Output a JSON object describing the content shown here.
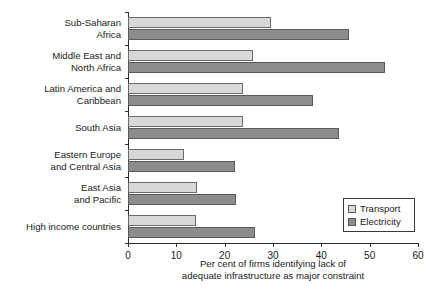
{
  "chart_data": {
    "type": "bar",
    "orientation": "horizontal",
    "title": "",
    "xlabel": "Per cent of firms identifying lack of\nadequate infrastructure as major constraint",
    "ylabel": "",
    "xlim": [
      0,
      60
    ],
    "xticks": [
      0,
      10,
      20,
      30,
      40,
      50,
      60
    ],
    "xtick_labels": [
      "0",
      "10",
      "20",
      "30",
      "40",
      "50",
      "60"
    ],
    "grid": false,
    "legend_position": "lower-right",
    "categories": [
      "Sub-Saharan\nAfrica",
      "Middle East and\nNorth Africa",
      "Latin America and\nCaribbean",
      "South Asia",
      "Eastern Europe\nand Central Asia",
      "East Asia\nand Pacific",
      "High income countries"
    ],
    "series": [
      {
        "name": "Transport",
        "color": "#d8d8d8",
        "values": [
          29.6,
          25.9,
          23.8,
          23.8,
          11.6,
          14.3,
          14.1
        ]
      },
      {
        "name": "Electricity",
        "color": "#8c8c8c",
        "values": [
          45.8,
          53.2,
          38.3,
          43.7,
          22.2,
          22.4,
          26.3
        ]
      }
    ]
  },
  "legend": {
    "entries": [
      {
        "label": "Transport",
        "swatch": "transport"
      },
      {
        "label": "Electricity",
        "swatch": "electricity"
      }
    ]
  }
}
